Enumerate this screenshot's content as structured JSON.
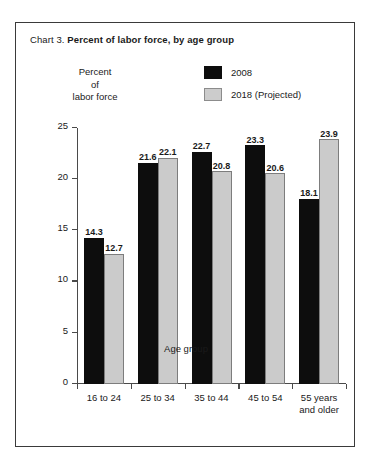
{
  "chart_data": {
    "type": "bar",
    "title": "Percent of labor force, by age group",
    "title_prefix": "Chart 3.",
    "xlabel": "Age group",
    "ylabel": "Percent\nof\nlabor force",
    "ylabel_lines": [
      "Percent",
      "of",
      "labor force"
    ],
    "categories": [
      "16 to 24",
      "25 to 34",
      "35 to 44",
      "45 to 54",
      "55 years\nand older"
    ],
    "series": [
      {
        "name": "2008",
        "color": "#0d0d0d",
        "values": [
          14.3,
          21.6,
          22.7,
          23.3,
          18.1
        ]
      },
      {
        "name": "2018 (Projected)",
        "color": "#cbcbcb",
        "values": [
          12.7,
          22.1,
          20.8,
          20.6,
          23.9
        ]
      }
    ],
    "ylim": [
      0,
      25
    ],
    "yticks": [
      0,
      5,
      10,
      15,
      20,
      25
    ],
    "ytick_labels": [
      "0",
      "5",
      "10",
      "15",
      "20",
      "25"
    ],
    "grid": false,
    "legend_position": "top-right",
    "value_labels": true
  },
  "legend": {
    "items": [
      {
        "label": "2008",
        "swatch": "black"
      },
      {
        "label": "2018 (Projected)",
        "swatch": "gray"
      }
    ]
  },
  "colors": {
    "series_2008": "#0d0d0d",
    "series_2018": "#cbcbcb",
    "series_2018_border": "#7d7d7d",
    "frame": "#3a3a3a",
    "axis": "#4a4a4a",
    "text": "#1a1a1a",
    "background": "#ffffff"
  }
}
